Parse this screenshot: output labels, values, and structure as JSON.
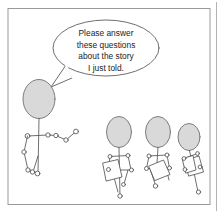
{
  "panel": {
    "title": "Teacher asking students comprehension questions",
    "background_color": "#ffffff",
    "frame_color": "#9a9a9a",
    "ink_color": "#555555",
    "head_fill_color": "#d9d9d9",
    "paper_fill_color": "#ffffff",
    "text_color": "#242424"
  },
  "speech_bubble": {
    "name": "speech-bubble",
    "lines": [
      "Please answer",
      "these questions",
      "about the story",
      "I just told."
    ],
    "full_text": "Please answer these questions about the story I just told."
  },
  "figures": [
    {
      "name": "teacher",
      "role": "teacher",
      "position": "left",
      "holding": "none",
      "speaking": true
    },
    {
      "name": "student-1",
      "role": "student",
      "position": "center-left",
      "holding": "paper",
      "speaking": false
    },
    {
      "name": "student-2",
      "role": "student",
      "position": "center-right",
      "holding": "paper",
      "speaking": false
    },
    {
      "name": "student-3",
      "role": "student",
      "position": "right",
      "holding": "paper",
      "speaking": false
    }
  ]
}
